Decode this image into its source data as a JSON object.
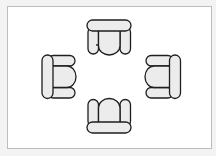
{
  "diagram": {
    "title": "Four armchairs floor plan (top view)",
    "type": "floor-plan",
    "colors": {
      "page_background": "#f3f3f3",
      "frame_background": "#ffffff",
      "frame_border": "#bdbdbd",
      "cushion_fill": "#ececec",
      "outline": "#1e1e1e"
    },
    "furniture": [
      {
        "id": "chair-top",
        "type": "armchair",
        "facing": "down"
      },
      {
        "id": "chair-left",
        "type": "armchair",
        "facing": "right"
      },
      {
        "id": "chair-right",
        "type": "armchair",
        "facing": "left"
      },
      {
        "id": "chair-bottom",
        "type": "armchair",
        "facing": "up"
      }
    ],
    "arrangement": "four armchairs facing a common center"
  }
}
